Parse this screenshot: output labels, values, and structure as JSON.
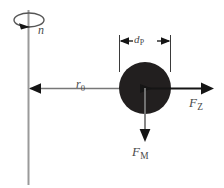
{
  "figure": {
    "type": "technical-diagram",
    "width": 224,
    "height": 188,
    "background_color": "#ffffff"
  },
  "colors": {
    "axis_line": "#9a9a9a",
    "vector_line": "#555555",
    "particle_fill": "#221f1f",
    "dimension_line": "#3a3a3a",
    "label_text": "#4a4a4a"
  },
  "labels": {
    "rotation_speed": {
      "symbol": "n",
      "subscript": ""
    },
    "radius": {
      "symbol": "r",
      "subscript": "0"
    },
    "particle_diameter": {
      "symbol": "d",
      "subscript": "P"
    },
    "centrifugal_force": {
      "symbol": "F",
      "subscript": "Z"
    },
    "gravity_force": {
      "symbol": "F",
      "subscript": "M"
    }
  },
  "elements": {
    "rotation_axis": {
      "name": "rotation-axis",
      "x": 28,
      "y_top": 10,
      "y_bottom": 185
    },
    "rotation_arrow": {
      "name": "rotation-direction-ellipse",
      "cx": 28,
      "cy": 20,
      "rx": 15,
      "ry": 7
    },
    "radius_vector": {
      "name": "radius-vector-r0",
      "x_from": 145,
      "x_to": 30,
      "y": 88
    },
    "particle": {
      "name": "particle",
      "cx": 145,
      "cy": 88,
      "r": 26
    },
    "diameter_dimension": {
      "name": "diameter-dimension-dp",
      "x_left": 119,
      "x_right": 171,
      "y": 41
    },
    "centrifugal_vector": {
      "name": "centrifugal-force-vector-fz",
      "x_from": 145,
      "x_to": 214,
      "y": 88
    },
    "gravity_vector": {
      "name": "gravity-force-vector-fm",
      "x": 145,
      "y_from": 88,
      "y_to": 141
    }
  }
}
